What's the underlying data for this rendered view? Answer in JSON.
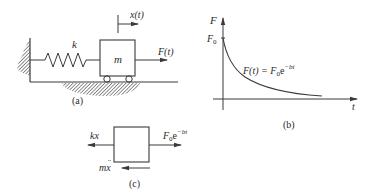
{
  "figure": {
    "panels": [
      {
        "id": "a",
        "caption": "(a)",
        "labels": {
          "spring": "k",
          "mass": "m",
          "displacement": "x(t)",
          "force": "F(t)"
        }
      },
      {
        "id": "b",
        "caption": "(b)",
        "labels": {
          "y_axis": "F",
          "x_axis": "t",
          "y_tick": "F",
          "y_tick_sub": "0",
          "curve_lhs": "F(t) = F",
          "curve_sub": "0",
          "curve_e": "e",
          "curve_exp": "−bt"
        }
      },
      {
        "id": "c",
        "caption": "(c)",
        "labels": {
          "spring_force": "kx",
          "applied_force": "F",
          "applied_force_sub": "0",
          "applied_force_e": "e",
          "applied_force_exp": "−bt",
          "inertia_m": "m",
          "inertia_x": "x",
          "inertia_ddot": "¨"
        }
      }
    ],
    "colors": {
      "line": "#3a3a3a",
      "hatch": "#555555",
      "text": "#2a2a2a",
      "background": "#ffffff"
    }
  }
}
